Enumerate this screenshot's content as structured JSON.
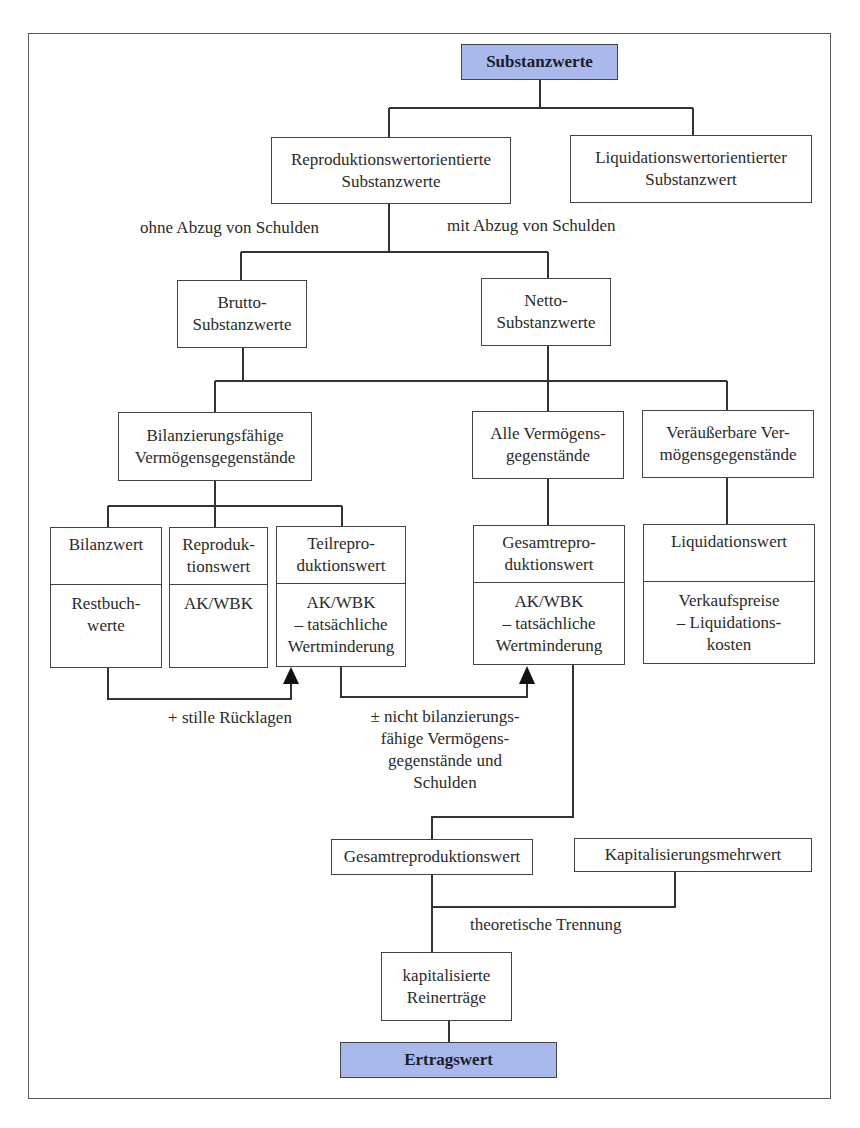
{
  "diagram": {
    "type": "hierarchy",
    "accent_color": "#a9b9eb",
    "root": {
      "label": "Substanzwerte"
    },
    "level1": {
      "reproduktion": {
        "label": "Reproduktionswertorientierte\nSubstanzwerte"
      },
      "liquidation": {
        "label": "Liquidationswertorientierter\nSubstanzwert"
      }
    },
    "edge_labels": {
      "ohne_schulden": "ohne Abzug von Schulden",
      "mit_schulden": "mit Abzug von Schulden",
      "stille_ruecklagen": "+ stille Rücklagen",
      "nicht_bilanzierungsfaehig": "± nicht bilanzierungs-\nfähige Vermögens-\ngegenstände und\nSchulden",
      "theoretische_trennung": "theoretische Trennung"
    },
    "level2": {
      "brutto": {
        "label": "Brutto-\nSubstanzwerte"
      },
      "netto": {
        "label": "Netto-\nSubstanzwerte"
      }
    },
    "level3": {
      "bilanzierungsfaehig": {
        "label": "Bilanzierungsfähige\nVermögensgegenstände"
      },
      "alle": {
        "label": "Alle Vermögens-\ngegenstände"
      },
      "veraeusserbar": {
        "label": "Veräußerbare Ver-\nmögensgegenstände"
      }
    },
    "level4": {
      "bilanzwert": {
        "title": "Bilanzwert",
        "value": "Restbuch-\nwerte"
      },
      "reproduktionswert": {
        "title": "Reproduk-\ntionswert",
        "value": "AK/WBK"
      },
      "teilreproduktionswert": {
        "title": "Teilrepro-\nduktionswert",
        "value": "AK/WBK\n– tatsächliche\nWertminderung"
      },
      "gesamtreproduktionswert": {
        "title": "Gesamtrepro-\nduktionswert",
        "value": "AK/WBK\n– tatsächliche\nWertminderung"
      },
      "liquidationswert": {
        "title": "Liquidationswert",
        "value": "Verkaufspreise\n– Liquidations-\nkosten"
      }
    },
    "level5": {
      "gesamtreproduktionswert": {
        "label": "Gesamtreproduktionswert"
      },
      "kapitalisierungsmehrwert": {
        "label": "Kapitalisierungsmehrwert"
      },
      "kapitalisierte_reinertraege": {
        "label": "kapitalisierte\nReinerträge"
      }
    },
    "result": {
      "label": "Ertragswert"
    }
  }
}
